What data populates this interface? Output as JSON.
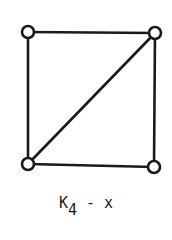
{
  "diagram": {
    "title": "K4 - x",
    "caption": {
      "base": "K",
      "subscript": "4",
      "rest": " - x"
    },
    "colors": {
      "stroke": "#1a1a1a",
      "fill": "#ffffff"
    },
    "vertex_radius": 6,
    "stroke_width": 2.6,
    "vertices": [
      {
        "id": "v1",
        "x": 28,
        "y": 32
      },
      {
        "id": "v2",
        "x": 155,
        "y": 33
      },
      {
        "id": "v3",
        "x": 28,
        "y": 164
      },
      {
        "id": "v4",
        "x": 154,
        "y": 167
      }
    ],
    "edges": [
      {
        "from": "v1",
        "to": "v2"
      },
      {
        "from": "v2",
        "to": "v4"
      },
      {
        "from": "v4",
        "to": "v3"
      },
      {
        "from": "v3",
        "to": "v1"
      },
      {
        "from": "v3",
        "to": "v2"
      }
    ]
  }
}
